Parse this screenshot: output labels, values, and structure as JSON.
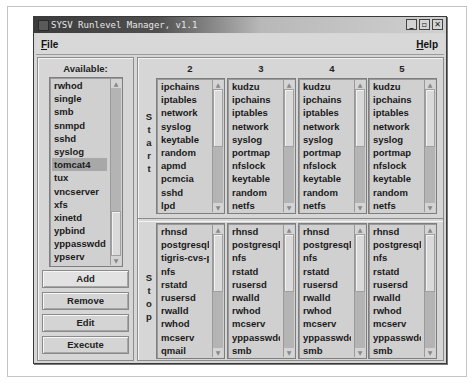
{
  "window": {
    "title": "SYSV Runlevel Manager, v1.1",
    "controls": {
      "minimize": "_",
      "maximize": "▫",
      "close": "✕"
    }
  },
  "menu": {
    "file_label": "File",
    "file_mnemonic": "F",
    "file_rest": "ile",
    "help_label": "Help",
    "help_mnemonic": "H",
    "help_rest": "elp"
  },
  "available": {
    "label": "Available:",
    "items": [
      "rwhod",
      "single",
      "smb",
      "snmpd",
      "sshd",
      "syslog",
      "tomcat4",
      "tux",
      "vncserver",
      "xfs",
      "xinetd",
      "ypbind",
      "yppasswdd",
      "ypserv"
    ],
    "selected": "tomcat4"
  },
  "buttons": {
    "add": "Add",
    "remove": "Remove",
    "edit": "Edit",
    "execute": "Execute"
  },
  "runlevels": {
    "headers": [
      "2",
      "3",
      "4",
      "5"
    ],
    "start_label": [
      "S",
      "t",
      "a",
      "r",
      "t"
    ],
    "stop_label": [
      "S",
      "t",
      "o",
      "p"
    ],
    "start": [
      [
        "ipchains",
        "iptables",
        "network",
        "syslog",
        "keytable",
        "random",
        "apmd",
        "pcmcia",
        "sshd",
        "lpd"
      ],
      [
        "kudzu",
        "ipchains",
        "iptables",
        "network",
        "syslog",
        "portmap",
        "nfslock",
        "keytable",
        "random",
        "netfs"
      ],
      [
        "kudzu",
        "ipchains",
        "iptables",
        "network",
        "syslog",
        "portmap",
        "nfslock",
        "keytable",
        "random",
        "netfs"
      ],
      [
        "kudzu",
        "ipchains",
        "iptables",
        "network",
        "syslog",
        "portmap",
        "nfslock",
        "keytable",
        "random",
        "netfs"
      ]
    ],
    "stop": [
      [
        "rhnsd",
        "postgresql",
        "tigris-cvs-ps",
        "nfs",
        "rstatd",
        "rusersd",
        "rwalld",
        "rwhod",
        "mcserv",
        "qmail"
      ],
      [
        "rhnsd",
        "postgresql",
        "nfs",
        "rstatd",
        "rusersd",
        "rwalld",
        "rwhod",
        "mcserv",
        "yppasswdd",
        "smb"
      ],
      [
        "rhnsd",
        "postgresql",
        "nfs",
        "rstatd",
        "rusersd",
        "rwalld",
        "rwhod",
        "mcserv",
        "yppasswdd",
        "smb"
      ],
      [
        "rhnsd",
        "postgresql",
        "nfs",
        "rstatd",
        "rusersd",
        "rwalld",
        "rwhod",
        "mcserv",
        "yppasswdd",
        "smb"
      ]
    ]
  },
  "scroll_icons": {
    "up": "▲",
    "down": "▼"
  }
}
